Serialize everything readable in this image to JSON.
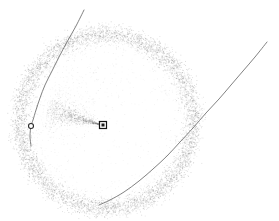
{
  "figure": {
    "title": "",
    "background_color": "#ffffff",
    "width": 279,
    "height": 221,
    "caption": ""
  },
  "chart_data": {
    "type": "scatter",
    "title": "",
    "subtitle": "",
    "xlabel": "",
    "ylabel": "",
    "xlim": [
      0,
      279
    ],
    "ylim": [
      0,
      221
    ],
    "grid": false,
    "axes_visible": false,
    "tick_labels_x": [],
    "tick_labels_y": [],
    "legend": {
      "visible": false,
      "position": "none",
      "entries": []
    },
    "annotations": [],
    "series": [
      {
        "name": "ring-particle-cloud",
        "type": "scatter",
        "marker": "point",
        "color": "#808080",
        "point_count": 5200,
        "geometry": "annulus",
        "center": [
          106,
          121
        ],
        "radius_mean": 87,
        "radius_sigma": 5.0,
        "opacity": 0.42,
        "point_size": 0.85
      },
      {
        "name": "ring-inner-haze",
        "type": "scatter",
        "marker": "point",
        "color": "#9a9a9a",
        "point_count": 900,
        "geometry": "annulus",
        "center": [
          106,
          121
        ],
        "radius_mean": 80,
        "radius_sigma": 7.0,
        "opacity": 0.22,
        "point_size": 0.8
      },
      {
        "name": "central-jet-streak",
        "type": "scatter",
        "marker": "point",
        "color": "#707070",
        "point_count": 620,
        "geometry": "cone",
        "apex": [
          103,
          125
        ],
        "direction_deg": 196,
        "length": 58,
        "spread_deg": 9,
        "opacity": 0.5,
        "point_size": 0.9
      },
      {
        "name": "diffuse-interior-debris",
        "type": "scatter",
        "marker": "point",
        "color": "#8c8c8c",
        "point_count": 420,
        "geometry": "fan",
        "apex": [
          101,
          127
        ],
        "direction_deg": 215,
        "length": 66,
        "spread_deg": 42,
        "opacity": 0.3,
        "point_size": 0.85
      },
      {
        "name": "sparse-interior-field",
        "type": "scatter",
        "marker": "point",
        "color": "#b4b4b4",
        "point_count": 260,
        "geometry": "disc",
        "center": [
          106,
          121
        ],
        "radius_mean": 72,
        "opacity": 0.3,
        "point_size": 0.8
      }
    ],
    "curves": [
      {
        "name": "left-trajectory",
        "color": "#6a6a6a",
        "linewidth": 0.85,
        "points": [
          [
            84,
            10
          ],
          [
            76,
            26
          ],
          [
            67,
            42
          ],
          [
            59,
            57
          ],
          [
            52,
            71
          ],
          [
            45,
            85
          ],
          [
            40,
            98
          ],
          [
            36,
            110
          ],
          [
            33,
            120
          ],
          [
            31,
            126
          ],
          [
            30,
            136
          ],
          [
            31,
            146
          ]
        ]
      },
      {
        "name": "right-trajectory",
        "color": "#6a6a6a",
        "linewidth": 0.85,
        "points": [
          [
            267,
            42
          ],
          [
            255,
            57
          ],
          [
            243,
            71
          ],
          [
            231,
            85
          ],
          [
            219,
            99
          ],
          [
            206,
            113
          ],
          [
            193,
            128
          ],
          [
            180,
            142
          ],
          [
            167,
            156
          ],
          [
            153,
            169
          ],
          [
            139,
            181
          ],
          [
            124,
            192
          ],
          [
            110,
            200
          ],
          [
            99,
            205
          ]
        ]
      }
    ],
    "markers": [
      {
        "name": "center-square-marker",
        "shape": "square",
        "x": 103,
        "y": 125,
        "size": 7,
        "facecolor": "#ffffff",
        "edgecolor": "#141414",
        "inner_facecolor": "#1a1a1a",
        "label": ""
      },
      {
        "name": "left-open-circle-marker",
        "shape": "circle",
        "x": 31,
        "y": 126,
        "size": 5,
        "facecolor": "#ffffff",
        "edgecolor": "#2b2b2b",
        "label": ""
      }
    ]
  }
}
